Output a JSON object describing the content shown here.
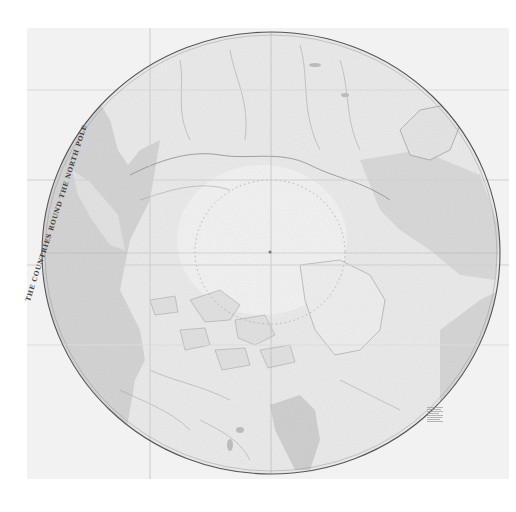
{
  "map": {
    "title": "THE COUNTRIES ROUND THE NORTH POLE",
    "projection": "polar",
    "center_label": "North Pole",
    "regions": [
      {
        "name": "Pacific Ocean",
        "position": "lower-left",
        "shade": "#d4d4d4"
      },
      {
        "name": "Hudson Bay",
        "position": "lower-center",
        "shade": "#cfcfcf"
      },
      {
        "name": "Greenland",
        "position": "right-center"
      },
      {
        "name": "Scandinavia / Europe",
        "position": "top-right"
      },
      {
        "name": "Siberia",
        "position": "top-left"
      },
      {
        "name": "Alaska",
        "position": "left"
      },
      {
        "name": "Canadian Arctic Archipelago",
        "position": "center-lower"
      }
    ],
    "legend": {
      "position": "bottom-right",
      "lines": 8,
      "text": ""
    },
    "colors": {
      "background": "#ffffff",
      "paper": "#f2f2f2",
      "ocean": "#d4d4d4",
      "border": "#555555",
      "land_line": "#8a8a8a"
    }
  }
}
